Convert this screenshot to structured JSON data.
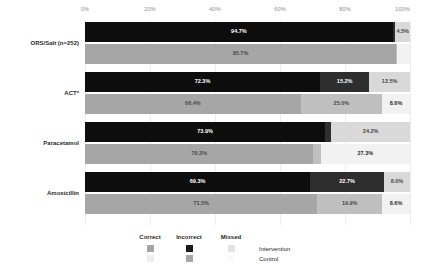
{
  "chart_data": {
    "type": "bar",
    "subtype": "horizontal-100-percent-stacked",
    "title": "",
    "xlabel": "",
    "ylabel": "",
    "xlim": [
      0,
      100
    ],
    "xticks": [
      "0%",
      "20%",
      "40%",
      "60%",
      "80%",
      "100%"
    ],
    "xtick_values": [
      0,
      20,
      40,
      60,
      80,
      100
    ],
    "grid": true,
    "legend_position": "bottom",
    "categories": [
      "ORS/Salt  (n=252)",
      "ACT*",
      "Paracetamol",
      "Amoxicillin"
    ],
    "stack_segments": [
      "Correct",
      "Incorrect",
      "Missed"
    ],
    "groups": [
      "Intervention",
      "Control"
    ],
    "series": [
      {
        "name": "Intervention",
        "segments": [
          {
            "name": "Correct",
            "values": [
              94.7,
              72.3,
              73.9,
              69.3
            ],
            "labels": [
              "94.7%",
              "72.3%",
              "73.9%",
              "69.3%"
            ],
            "color": "#0d0d0d"
          },
          {
            "name": "Incorrect",
            "values": [
              0.8,
              15.2,
              1.9,
              22.7
            ],
            "labels": [
              "0.8%",
              "15.2%",
              "1.9%",
              "22.7%"
            ],
            "color": "#2e2e2e"
          },
          {
            "name": "Missed",
            "values": [
              4.5,
              12.5,
              24.2,
              8.0
            ],
            "labels": [
              "4.5%",
              "12.5%",
              "24.2%",
              "8.0%"
            ],
            "color": "#d9d9d9"
          }
        ]
      },
      {
        "name": "Control",
        "segments": [
          {
            "name": "Correct",
            "values": [
              95.7,
              66.4,
              70.3,
              71.5
            ],
            "labels": [
              "95.7%",
              "66.4%",
              "70.3%",
              "71.5%"
            ],
            "color": "#a6a6a6"
          },
          {
            "name": "Incorrect",
            "values": [
              0.4,
              25.0,
              2.3,
              19.9
            ],
            "labels": [
              "0.4%",
              "25.0%",
              "2.3%",
              "19.9%"
            ],
            "color": "#bfbfbf"
          },
          {
            "name": "Missed",
            "values": [
              3.9,
              8.6,
              27.3,
              8.6
            ],
            "labels": [
              "3.9%",
              "8.6%",
              "27.3%",
              "8.6%"
            ],
            "color": "#f2f2f2"
          }
        ]
      }
    ]
  },
  "axis": {
    "ticks": [
      {
        "label": "0%",
        "value": 0
      },
      {
        "label": "20%",
        "value": 20
      },
      {
        "label": "40%",
        "value": 40
      },
      {
        "label": "60%",
        "value": 60
      },
      {
        "label": "80%",
        "value": 80
      },
      {
        "label": "100%",
        "value": 100
      }
    ]
  },
  "legend": {
    "column_headers": [
      "Correct",
      "Incorrect",
      "Missed"
    ],
    "rows": [
      {
        "name": "Intervention",
        "swatches": [
          "#a6a6a6",
          "#1a1a1a",
          "#e3e3e3"
        ]
      },
      {
        "name": "Control",
        "swatches": [
          "#ededed",
          "#a6a6a6",
          "#fafafa"
        ]
      }
    ]
  }
}
